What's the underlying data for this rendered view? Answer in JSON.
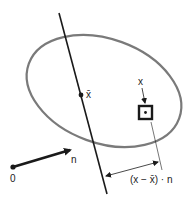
{
  "diagram": {
    "colors": {
      "ellipse": "#7a7a7a",
      "line": "#1a1a1a",
      "text": "#222222"
    },
    "labels": {
      "centroid": "x̄",
      "point": "x",
      "normal": "n",
      "origin": "0",
      "distance": "(x − x̄) · n"
    }
  }
}
